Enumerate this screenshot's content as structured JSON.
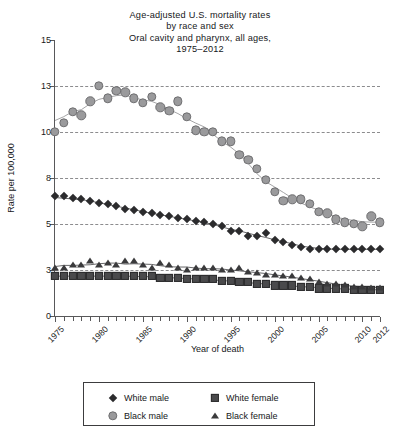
{
  "chart_data": {
    "type": "line",
    "title": "Age-adjusted U.S. mortality rates by race and sex Oral cavity and pharynx, all ages, 1975–2012",
    "title_lines": [
      "Age-adjusted U.S. mortality rates",
      "by race and sex",
      "Oral cavity and pharynx, all ages,",
      "1975–2012"
    ],
    "xlabel": "Year of death",
    "ylabel": "Rate per 100,000",
    "ylim": [
      0,
      15
    ],
    "xlim": [
      1975,
      2012
    ],
    "grid": true,
    "legend_position": "bottom",
    "y_ticks": [
      0,
      3,
      5,
      8,
      10,
      13,
      15
    ],
    "y_tick_labels": [
      "0",
      "3",
      "5",
      "8",
      "10",
      "13",
      "15"
    ],
    "x_ticks": [
      1975,
      1980,
      1985,
      1990,
      1995,
      2000,
      2005,
      2010,
      2012
    ],
    "x_tick_labels": [
      "1975",
      "1980",
      "1985",
      "1990",
      "1995",
      "2000",
      "2005",
      "2010",
      "2012"
    ],
    "x_minor_ticks": [
      1976,
      1977,
      1978,
      1979,
      1981,
      1982,
      1983,
      1984,
      1986,
      1987,
      1988,
      1989,
      1991,
      1992,
      1993,
      1994,
      1996,
      1997,
      1998,
      1999,
      2001,
      2002,
      2003,
      2004,
      2006,
      2007,
      2008,
      2009,
      2011
    ],
    "x": [
      1975,
      1976,
      1977,
      1978,
      1979,
      1980,
      1981,
      1982,
      1983,
      1984,
      1985,
      1986,
      1987,
      1988,
      1989,
      1990,
      1991,
      1992,
      1993,
      1994,
      1995,
      1996,
      1997,
      1998,
      1999,
      2000,
      2001,
      2002,
      2003,
      2004,
      2005,
      2006,
      2007,
      2008,
      2009,
      2010,
      2011,
      2012
    ],
    "series": [
      {
        "name": "White male",
        "marker": "diamond",
        "color": "#2b2b2d",
        "values": [
          6.8,
          6.8,
          6.7,
          6.6,
          6.5,
          6.4,
          6.3,
          6.2,
          6.0,
          5.9,
          5.8,
          5.7,
          5.6,
          5.5,
          5.4,
          5.3,
          5.2,
          5.1,
          5.0,
          4.9,
          4.7,
          4.7,
          4.5,
          4.5,
          4.6,
          4.3,
          4.2,
          4.1,
          4.0,
          3.9,
          3.9,
          3.9,
          3.9,
          3.9,
          3.9,
          3.9,
          3.9,
          3.9
        ]
      },
      {
        "name": "Black male",
        "marker": "circle",
        "color": "#9a9a9c",
        "values": [
          10.0,
          10.6,
          11.3,
          11.1,
          12.0,
          13.0,
          12.2,
          12.7,
          12.6,
          12.2,
          11.9,
          12.3,
          11.6,
          11.4,
          12.0,
          11.0,
          10.1,
          10.0,
          10.0,
          9.6,
          9.6,
          9.0,
          8.8,
          8.4,
          7.9,
          7.1,
          6.5,
          6.6,
          6.6,
          6.3,
          5.8,
          5.7,
          5.3,
          5.1,
          5.0,
          4.9,
          5.5,
          5.1
        ]
      },
      {
        "name": "White female",
        "marker": "square",
        "color": "#4a4a4c",
        "values": [
          2.6,
          2.6,
          2.6,
          2.6,
          2.6,
          2.6,
          2.6,
          2.6,
          2.6,
          2.6,
          2.6,
          2.6,
          2.5,
          2.5,
          2.5,
          2.4,
          2.4,
          2.4,
          2.4,
          2.3,
          2.3,
          2.2,
          2.2,
          2.1,
          2.1,
          2.0,
          2.0,
          2.0,
          1.9,
          1.9,
          1.8,
          1.8,
          1.8,
          1.8,
          1.7,
          1.7,
          1.7,
          1.7
        ]
      },
      {
        "name": "Black female",
        "marker": "triangle",
        "color": "#3a3a3c",
        "values": [
          3.1,
          3.1,
          3.2,
          3.2,
          3.4,
          3.2,
          3.3,
          3.2,
          3.4,
          3.4,
          3.2,
          3.1,
          3.3,
          3.2,
          3.1,
          3.0,
          3.1,
          3.1,
          3.1,
          3.0,
          3.0,
          3.1,
          2.9,
          2.8,
          2.7,
          2.7,
          2.6,
          2.6,
          2.5,
          2.4,
          2.2,
          2.1,
          2.1,
          2.0,
          1.9,
          1.9,
          1.8,
          1.8
        ]
      }
    ]
  },
  "legend": {
    "items": [
      {
        "label": "White male",
        "marker": "diamond"
      },
      {
        "label": "White female",
        "marker": "square"
      },
      {
        "label": "Black male",
        "marker": "circle"
      },
      {
        "label": "Black female",
        "marker": "triangle"
      }
    ]
  }
}
